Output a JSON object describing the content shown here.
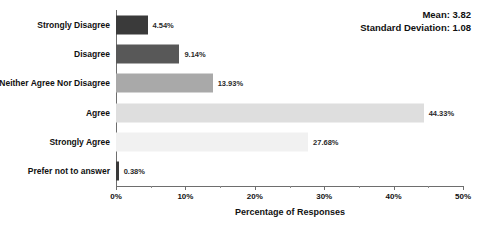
{
  "chart_data": {
    "type": "bar",
    "orientation": "horizontal",
    "title": "",
    "xlabel": "Percentage of Responses",
    "ylabel": "",
    "xlim": [
      0,
      50
    ],
    "xticks": [
      "0%",
      "10%",
      "20%",
      "30%",
      "40%",
      "50%"
    ],
    "xtick_values": [
      0,
      10,
      20,
      30,
      40,
      50
    ],
    "minor_tick_interval": 5,
    "grid": false,
    "legend": false,
    "categories": [
      "Strongly Disagree",
      "Disagree",
      "Neither Agree Nor Disagree",
      "Agree",
      "Strongly Agree",
      "Prefer not to answer"
    ],
    "values": [
      4.54,
      9.14,
      13.93,
      44.33,
      27.68,
      0.38
    ],
    "data_labels": [
      "4.54%",
      "9.14%",
      "13.93%",
      "44.33%",
      "27.68%",
      "0.38%"
    ],
    "bar_colors": [
      "#3a3a3a",
      "#585858",
      "#a9a9a9",
      "#dedede",
      "#f1f1f1",
      "#3a3a3a"
    ],
    "annotations": {
      "mean_label": "Mean: 3.82",
      "std_label": "Standard Deviation: 1.08"
    }
  },
  "axis": {
    "line_color": "#6e6e6e"
  }
}
